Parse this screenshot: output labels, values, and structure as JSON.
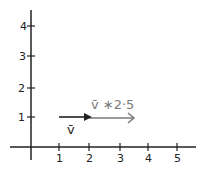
{
  "diagram": {
    "x_ticks": [
      "1",
      "2",
      "3",
      "4",
      "5"
    ],
    "y_ticks": [
      "1",
      "2",
      "3",
      "4"
    ],
    "vectors": [
      {
        "name": "v",
        "label": "v̄",
        "start": [
          1,
          1
        ],
        "end": [
          2,
          1
        ],
        "color": "#222222"
      },
      {
        "name": "v_scaled",
        "label": "v̄ ∗2·5",
        "start": [
          1,
          1
        ],
        "end": [
          3.5,
          1
        ],
        "color": "#7a7a7a"
      }
    ]
  }
}
